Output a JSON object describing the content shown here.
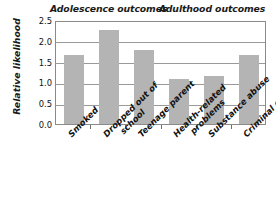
{
  "chart_data": {
    "type": "bar",
    "title": "",
    "xlabel": "",
    "ylabel": "Relative likelihood",
    "ylim": [
      0.0,
      2.5
    ],
    "ytick_labels": [
      "2.5",
      "2.0",
      "1.5",
      "1.0",
      "0.5",
      "0.0"
    ],
    "ytick_values": [
      2.5,
      2.0,
      1.5,
      1.0,
      0.5,
      0.0
    ],
    "grid": true,
    "legend": "none",
    "bar_color": "#b4b4b4",
    "categories": [
      "Smoked",
      "Dropped out of school",
      "Teenage parent",
      "Health-related problems",
      "Substance abuse",
      "Criminal conviction"
    ],
    "values": [
      1.67,
      2.27,
      1.77,
      1.08,
      1.16,
      1.67
    ],
    "annotations": [
      "Adolescence outcomes",
      "Adulthood outcomes"
    ],
    "groups": [
      {
        "name": "Adolescence outcomes",
        "categories": [
          "Smoked",
          "Dropped out of school",
          "Teenage parent"
        ]
      },
      {
        "name": "Adulthood outcomes",
        "categories": [
          "Health-related problems",
          "Substance abuse",
          "Criminal conviction"
        ]
      }
    ]
  },
  "groups": {
    "adolescence": "Adolescence outcomes",
    "adulthood": "Adulthood outcomes"
  },
  "axis": {
    "y_title": "Relative likelihood"
  },
  "category_labels": [
    {
      "line1": "Smoked",
      "line2": ""
    },
    {
      "line1": "Dropped out of",
      "line2": "school"
    },
    {
      "line1": "Teenage parent",
      "line2": ""
    },
    {
      "line1": "Health-related",
      "line2": "problems"
    },
    {
      "line1": "Substance abuse",
      "line2": ""
    },
    {
      "line1": "Criminal conviction",
      "line2": ""
    }
  ]
}
